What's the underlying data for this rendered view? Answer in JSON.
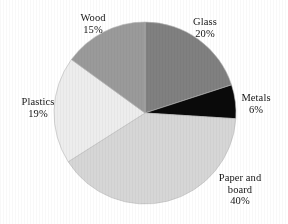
{
  "chart_data": {
    "type": "pie",
    "title": "",
    "subtitle": "",
    "xlabel": "",
    "ylabel": "",
    "legend_position": "none",
    "grid": false,
    "labels_outside": true,
    "unit": "%",
    "total": 100,
    "categories": [
      "Glass",
      "Metals",
      "Paper and board",
      "Plastics",
      "Wood"
    ],
    "values": [
      20,
      6,
      40,
      19,
      15
    ],
    "start_angle_deg": 0,
    "direction": "clockwise",
    "slices": [
      {
        "name": "Glass",
        "label": "Glass",
        "value": 20,
        "value_text": "20%",
        "color": "#808080",
        "start_deg": 0,
        "end_deg": 72
      },
      {
        "name": "Metals",
        "label": "Metals",
        "value": 6,
        "value_text": "6%",
        "color": "#0a0a0a",
        "start_deg": 72,
        "end_deg": 93.6
      },
      {
        "name": "Paper and board",
        "label": "Paper and\nboard",
        "value": 40,
        "value_text": "40%",
        "color": "#d6d6d6",
        "start_deg": 93.6,
        "end_deg": 237.6
      },
      {
        "name": "Plastics",
        "label": "Plastics",
        "value": 19,
        "value_text": "19%",
        "color": "#ededed",
        "start_deg": 237.6,
        "end_deg": 306
      },
      {
        "name": "Wood",
        "label": "Wood",
        "value": 15,
        "value_text": "15%",
        "color": "#9a9a9a",
        "start_deg": 306,
        "end_deg": 360
      }
    ]
  },
  "labels": {
    "glass": "Glass\n20%",
    "metals": "Metals\n6%",
    "paper": "Paper and\nboard\n40%",
    "plastics": "Plastics\n19%",
    "wood": "Wood\n15%"
  },
  "geometry": {
    "center_x": 145,
    "center_y": 113,
    "radius": 91
  },
  "colors": {
    "background": "#ffffff",
    "text": "#161616",
    "glass": "#808080",
    "metals": "#0a0a0a",
    "paper": "#d6d6d6",
    "plastics": "#ededed",
    "wood": "#9a9a9a",
    "outline": "#b8b8b8"
  }
}
